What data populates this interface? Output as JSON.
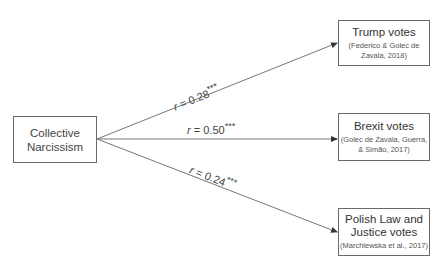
{
  "predictor": {
    "label": "Collective Narcissism"
  },
  "outcomes": [
    {
      "label": "Trump votes",
      "citation": "(Federico & Golec de Zavala, 2018)",
      "r_symbol": "r",
      "r_value": "= 0.28",
      "significance": "***"
    },
    {
      "label": "Brexit votes",
      "citation": "(Golec de Zavala, Guerra, & Simão, 2017)",
      "r_symbol": "r",
      "r_value": "= 0.50",
      "significance": "***"
    },
    {
      "label": "Polish Law and Justice votes",
      "citation": "(Marchlewska et al., 2017)",
      "r_symbol": "r",
      "r_value": "= 0.24",
      "significance": "***"
    }
  ]
}
